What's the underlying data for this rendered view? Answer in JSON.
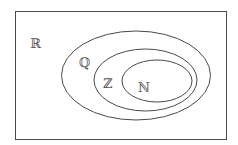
{
  "diagram": {
    "colors": {
      "stroke": "#4a4a4a",
      "text": "#555555",
      "background": "#ffffff"
    },
    "sets": [
      {
        "id": "reals",
        "label": "ℝ"
      },
      {
        "id": "rationals",
        "label": "ℚ"
      },
      {
        "id": "integers",
        "label": "ℤ"
      },
      {
        "id": "naturals",
        "label": "ℕ"
      }
    ]
  }
}
